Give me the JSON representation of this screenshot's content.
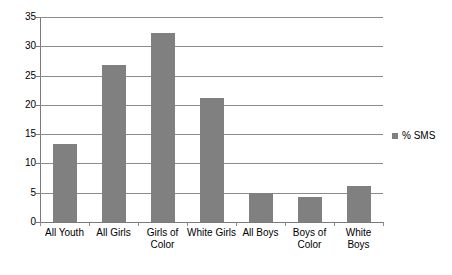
{
  "chart_data": {
    "type": "bar",
    "title": "",
    "subtitle": "",
    "xlabel": "",
    "ylabel": "",
    "categories": [
      "All Youth",
      "All Girls",
      "Girls of Color",
      "White Girls",
      "All Boys",
      "Boys of Color",
      "White Boys"
    ],
    "series": [
      {
        "name": "% SMS",
        "color": "#808080",
        "values": [
          13.3,
          26.8,
          32.3,
          21.1,
          5.0,
          4.2,
          6.1
        ]
      }
    ],
    "values": [
      13.3,
      26.8,
      32.3,
      21.1,
      5.0,
      4.2,
      6.1
    ],
    "ylim": [
      0,
      35
    ],
    "ytick_values": [
      0,
      5,
      10,
      15,
      20,
      25,
      30,
      35
    ],
    "ytick_labels": [
      "0",
      "5",
      "10",
      "15",
      "20",
      "25",
      "30",
      "35"
    ],
    "grid": true,
    "grid_axis": "y",
    "legend": {
      "position": "right",
      "entries": [
        {
          "label": "% SMS",
          "color": "#808080",
          "marker": "square"
        }
      ]
    },
    "bar_color": "#808080",
    "gridline_color": "#8c8c8c",
    "axis_color": "#7a7a7a",
    "background": "#ffffff"
  }
}
